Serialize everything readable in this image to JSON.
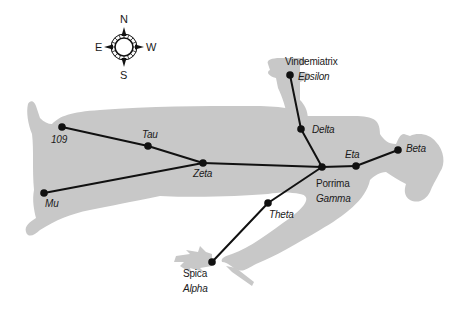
{
  "diagram": {
    "silhouette_color": "#c8c8c8",
    "line_color": "#111111",
    "star_color": "#111111"
  },
  "compass": {
    "north": "N",
    "south": "S",
    "east": "E",
    "west": "W"
  },
  "stars": [
    {
      "id": "109",
      "name": "109",
      "proper": "",
      "x": 62,
      "y": 127
    },
    {
      "id": "tau",
      "name": "Tau",
      "proper": "",
      "x": 148,
      "y": 146
    },
    {
      "id": "zeta",
      "name": "Zeta",
      "proper": "",
      "x": 203,
      "y": 163
    },
    {
      "id": "mu",
      "name": "Mu",
      "proper": "",
      "x": 44,
      "y": 193
    },
    {
      "id": "gamma",
      "name": "Gamma",
      "proper": "Porrima",
      "x": 322,
      "y": 167
    },
    {
      "id": "eta",
      "name": "Eta",
      "proper": "",
      "x": 356,
      "y": 166
    },
    {
      "id": "beta",
      "name": "Beta",
      "proper": "",
      "x": 398,
      "y": 150
    },
    {
      "id": "delta",
      "name": "Delta",
      "proper": "",
      "x": 301,
      "y": 129
    },
    {
      "id": "epsilon",
      "name": "Epsilon",
      "proper": "Vindemiatrix",
      "x": 290,
      "y": 75
    },
    {
      "id": "theta",
      "name": "Theta",
      "proper": "",
      "x": 268,
      "y": 203
    },
    {
      "id": "alpha",
      "name": "Alpha",
      "proper": "Spica",
      "x": 212,
      "y": 262
    }
  ],
  "lines": [
    [
      "109",
      "tau"
    ],
    [
      "tau",
      "zeta"
    ],
    [
      "mu",
      "zeta"
    ],
    [
      "zeta",
      "gamma"
    ],
    [
      "gamma",
      "eta"
    ],
    [
      "eta",
      "beta"
    ],
    [
      "gamma",
      "delta"
    ],
    [
      "delta",
      "epsilon"
    ],
    [
      "gamma",
      "theta"
    ],
    [
      "theta",
      "alpha"
    ]
  ],
  "labels": {
    "l109": "109",
    "tau": "Tau",
    "zeta": "Zeta",
    "mu": "Mu",
    "porrima": "Porrima",
    "gamma": "Gamma",
    "eta": "Eta",
    "beta": "Beta",
    "delta": "Delta",
    "vindemiatrix": "Vindemiatrix",
    "epsilon": "Epsilon",
    "theta": "Theta",
    "spica": "Spica",
    "alpha": "Alpha"
  }
}
